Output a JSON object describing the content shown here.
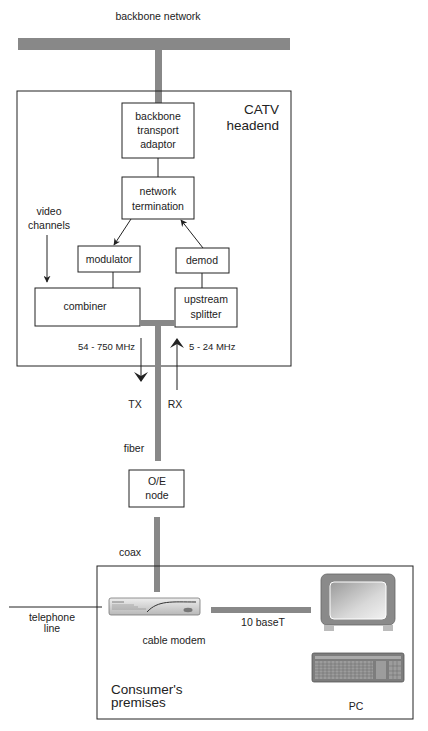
{
  "diagram": {
    "title": "backbone network",
    "headend": {
      "title_line1": "CATV",
      "title_line2": "headend",
      "boxes": {
        "backbone_adaptor": [
          "backbone",
          "transport",
          "adaptor"
        ],
        "network_termination": [
          "network",
          "termination"
        ],
        "modulator": [
          "modulator"
        ],
        "demod": [
          "demod"
        ],
        "combiner": [
          "combiner"
        ],
        "upstream_splitter": [
          "upstream",
          "splitter"
        ]
      },
      "video_channels": [
        "video",
        "channels"
      ],
      "downstream_band": "54 - 750 MHz",
      "upstream_band": "5 - 24 MHz"
    },
    "tx_label": "TX",
    "rx_label": "RX",
    "fiber_label": "fiber",
    "oe_node": [
      "O/E",
      "node"
    ],
    "coax_label": "coax",
    "premises": {
      "title_line1": "Consumer's",
      "title_line2": "premises",
      "telephone_line": [
        "telephone",
        "line"
      ],
      "cable_modem": "cable modem",
      "ethernet": "10 baseT",
      "pc": "PC"
    },
    "colors": {
      "pipe": "#888888",
      "line": "#222222",
      "monitor": "#8a8a8a",
      "screen": "#b5b5b5"
    }
  }
}
